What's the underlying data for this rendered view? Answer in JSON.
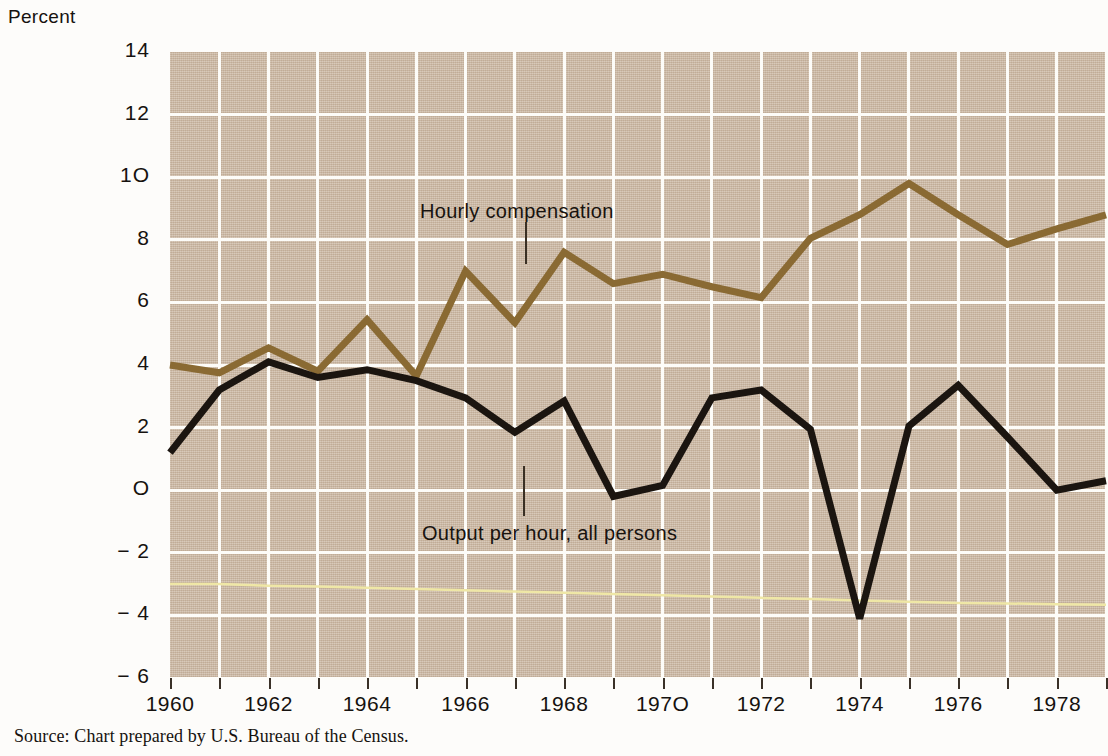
{
  "axis_title": "Percent",
  "source_note": "Source: Chart prepared by U.S. Bureau of the Census.",
  "annotations": {
    "series_brown": "Hourly compensation",
    "series_black": "Output per hour, all persons"
  },
  "colors": {
    "plot_background": "#cbb8a3",
    "gridline": "#fdfcf8",
    "hourly_compensation": "#8a6a33",
    "output_per_hour": "#1b1510",
    "reference_line": "#efe7a6",
    "page_background": "#fdfcfa",
    "text": "#16120f"
  },
  "chart_data": {
    "type": "line",
    "title": "",
    "xlabel": "",
    "ylabel": "Percent",
    "ylim": [
      -6,
      14
    ],
    "xlim": [
      1960,
      1979
    ],
    "ytick_values": [
      14,
      12,
      10,
      8,
      6,
      4,
      2,
      0,
      -2,
      -4,
      -6
    ],
    "ytick_labels": [
      "14",
      "12",
      "1O",
      "8",
      "6",
      "4",
      "2",
      "O",
      "− 2",
      "− 4",
      "− 6"
    ],
    "xtick_values": [
      1960,
      1961,
      1962,
      1963,
      1964,
      1965,
      1966,
      1967,
      1968,
      1969,
      1970,
      1971,
      1972,
      1973,
      1974,
      1975,
      1976,
      1977,
      1978,
      1979
    ],
    "xtick_labels_shown": [
      "1960",
      "1962",
      "1964",
      "1966",
      "1968",
      "197O",
      "1972",
      "1974",
      "1976",
      "1978"
    ],
    "xtick_labeled_values": [
      1960,
      1962,
      1964,
      1966,
      1968,
      1970,
      1972,
      1974,
      1976,
      1978
    ],
    "grid": true,
    "legend_position": "inline-annotation",
    "x": [
      1960,
      1961,
      1962,
      1963,
      1964,
      1965,
      1966,
      1967,
      1968,
      1969,
      1970,
      1971,
      1972,
      1973,
      1974,
      1975,
      1976,
      1977,
      1978,
      1979
    ],
    "series": [
      {
        "name": "Hourly compensation",
        "color": "#8a6a33",
        "values": [
          4.0,
          3.75,
          4.55,
          3.8,
          5.45,
          3.65,
          7.0,
          5.35,
          7.6,
          6.6,
          6.9,
          6.5,
          6.15,
          8.05,
          8.8,
          9.8,
          8.8,
          7.85,
          8.35,
          8.8
        ]
      },
      {
        "name": "Output per hour, all persons",
        "color": "#1b1510",
        "values": [
          1.2,
          3.2,
          4.1,
          3.6,
          3.85,
          3.5,
          2.95,
          1.85,
          2.85,
          -0.2,
          0.15,
          2.95,
          3.2,
          1.95,
          -4.1,
          2.05,
          3.35,
          1.7,
          0.0,
          0.3
        ]
      }
    ],
    "reference_line": {
      "name": "trend-reference",
      "color": "#efe7a6",
      "values": [
        -3.0,
        -3.0,
        -3.05,
        -3.08,
        -3.12,
        -3.16,
        -3.2,
        -3.24,
        -3.28,
        -3.32,
        -3.36,
        -3.4,
        -3.44,
        -3.48,
        -3.52,
        -3.56,
        -3.6,
        -3.62,
        -3.64,
        -3.66
      ]
    }
  }
}
